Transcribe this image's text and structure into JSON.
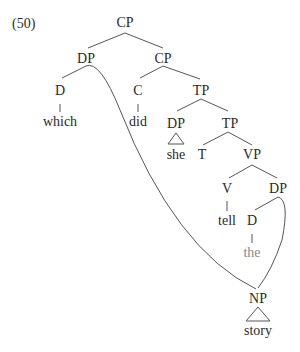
{
  "example_number": "(50)",
  "nodes": {
    "cp_root": "CP",
    "dp_wh": "DP",
    "cp_lower": "CP",
    "d_wh": "D",
    "which": "which",
    "c": "C",
    "did": "did",
    "tp_upper": "TP",
    "dp_subj": "DP",
    "she": "she",
    "tp_lower": "TP",
    "t": "T",
    "vp": "VP",
    "v": "V",
    "tell": "tell",
    "dp_obj": "DP",
    "d_obj": "D",
    "the": "the",
    "np": "NP",
    "story": "story"
  },
  "colors": {
    "text": "#2a2a2a",
    "stranded_determiner": "#8a8a8a",
    "lines": "#555555"
  }
}
